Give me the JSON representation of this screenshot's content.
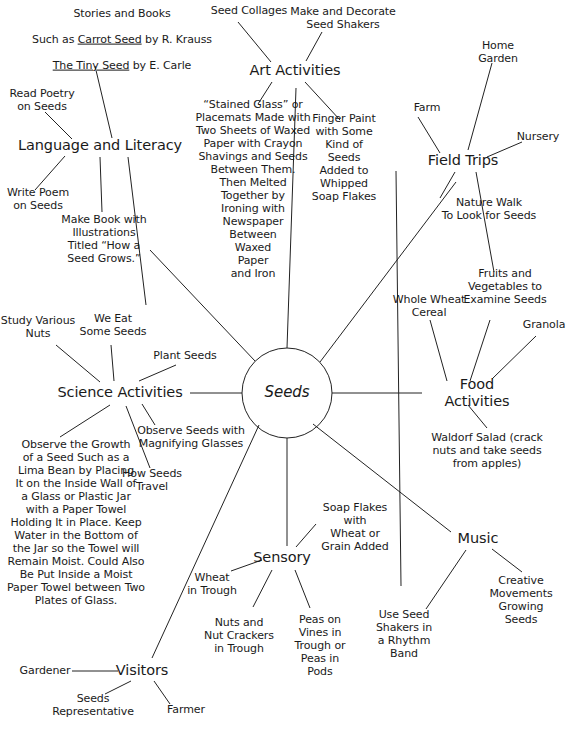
{
  "diagram": {
    "center": {
      "label": "Seeds"
    },
    "main_branches": [
      {
        "id": "language",
        "label": "Language and Literacy"
      },
      {
        "id": "art",
        "label": "Art Activities"
      },
      {
        "id": "field",
        "label": "Field Trips"
      },
      {
        "id": "food",
        "label": "Food Activities"
      },
      {
        "id": "music",
        "label": "Music"
      },
      {
        "id": "sensory",
        "label": "Sensory"
      },
      {
        "id": "visitors",
        "label": "Visitors"
      },
      {
        "id": "science",
        "label": "Science Activities"
      }
    ],
    "leaves": {
      "stories_books_line1": "Stories and Books",
      "stories_books_line2a": "Such as ",
      "stories_books_line2b": "Carrot Seed",
      "stories_books_line2c": " by R. Krauss",
      "stories_books_line3a": "The Tiny Seed",
      "stories_books_line3b": " by E. Carle",
      "read_poetry": "Read Poetry\non Seeds",
      "write_poem": "Write Poem\non Seeds",
      "make_book": "Make Book with\nIllustrations\nTitled “How a\nSeed Grows.”",
      "seed_collages": "Seed Collages",
      "make_decorate_shakers": "Make and Decorate\nSeed Shakers",
      "stained_glass": "“Stained Glass” or\nPlacemats Made with\nTwo Sheets of Waxed\nPaper with Crayon\nShavings and Seeds\nBetween Them.\nThen Melted\nTogether by\nIroning with\nNewspaper\nBetween\nWaxed\nPaper\nand Iron",
      "finger_paint": "Finger Paint\nwith Some\nKind of\nSeeds\nAdded to\nWhipped\nSoap Flakes",
      "home_garden": "Home\nGarden",
      "farm": "Farm",
      "nursery": "Nursery",
      "nature_walk": "Nature Walk\nTo Look for Seeds",
      "fruits_vegetables": "Fruits and\nVegetables to\nExamine Seeds",
      "granola": "Granola",
      "whole_wheat_cereal": "Whole Wheat\nCereal",
      "waldorf_salad": "Waldorf Salad (crack\nnuts and take seeds\nfrom apples)",
      "creative_movements": "Creative\nMovements\nGrowing\nSeeds",
      "use_seed_shakers": "Use Seed\nShakers in\na Rhythm\nBand",
      "soap_flakes_wheat": "Soap Flakes\nwith\nWheat or\nGrain Added",
      "peas_on_vines": "Peas on\nVines in\nTrough or\nPeas in\nPods",
      "nuts_crackers": "Nuts and\nNut Crackers\nin Trough",
      "wheat_in_trough": "Wheat\nin Trough",
      "gardener": "Gardener",
      "seeds_representative": "Seeds\nRepresentative",
      "farmer": "Farmer",
      "observe_growth": "Observe the Growth\nof a Seed Such as a\nLima Bean by Placing\nIt on the Inside Wall of\na Glass or Plastic Jar\nwith a Paper Towel\nHolding It in Place. Keep\nWater in the Bottom of\nthe Jar so the Towel will\nRemain Moist. Could Also\nBe Put Inside a Moist\nPaper Towel between Two\nPlates of Glass.",
      "how_seeds_travel": "How Seeds\nTravel",
      "observe_magnifying": "Observe Seeds with\nMagnifying Glasses",
      "plant_seeds": "Plant Seeds",
      "we_eat_some_seeds": "We Eat\nSome Seeds",
      "study_various_nuts": "Study Various\nNuts"
    },
    "colors": {
      "ink": "#1a1a1a",
      "line": "#222222",
      "background": "#ffffff"
    }
  }
}
